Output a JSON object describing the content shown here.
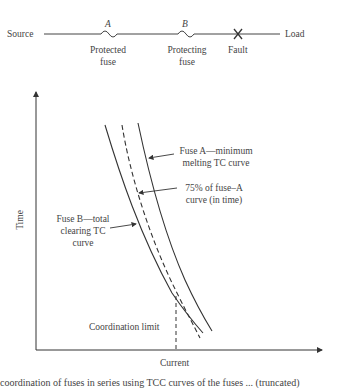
{
  "circuit": {
    "source_label": "Source",
    "load_label": "Load",
    "fuse_a": {
      "letter": "A",
      "label_line1": "Protected",
      "label_line2": "fuse"
    },
    "fuse_b": {
      "letter": "B",
      "label_line1": "Protecting",
      "label_line2": "fuse"
    },
    "fault_label": "Fault"
  },
  "graph": {
    "y_axis_label": "Time",
    "x_axis_label": "Current",
    "annotations": {
      "fuse_a_line1": "Fuse A—minimum",
      "fuse_a_line2": "melting TC curve",
      "pct75_line1": "75% of fuse–A",
      "pct75_line2": "curve (in time)",
      "fuse_b_line1": "Fuse B—total",
      "fuse_b_line2": "clearing TC",
      "fuse_b_line3": "curve",
      "coordination_limit": "Coordination limit"
    }
  },
  "caption": "coordination of fuses in series using TCC curves of the fuses ... (truncated)",
  "colors": {
    "line": "#333333",
    "text": "#444444",
    "background": "#ffffff"
  }
}
